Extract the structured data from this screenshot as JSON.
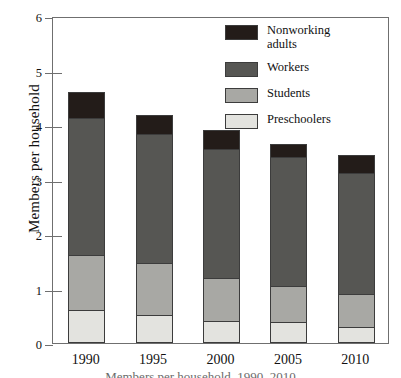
{
  "chart_data": {
    "type": "bar",
    "stacked": true,
    "title": "",
    "xlabel": "",
    "ylabel": "Members per household",
    "ylim": [
      0,
      6
    ],
    "yticks": [
      0,
      1,
      2,
      3,
      4,
      5,
      6
    ],
    "ytick_labels": [
      "0",
      "1",
      "2",
      "3",
      "4",
      "5",
      "6"
    ],
    "grid": false,
    "legend_position": "top-right",
    "categories": [
      "1990",
      "1995",
      "2000",
      "2005",
      "2010"
    ],
    "series": [
      {
        "name": "Preschoolers",
        "color": "#e3e3df",
        "values": [
          0.61,
          0.52,
          0.41,
          0.38,
          0.3
        ]
      },
      {
        "name": "Students",
        "color": "#a8a8a4",
        "values": [
          1.02,
          0.97,
          0.8,
          0.69,
          0.62
        ]
      },
      {
        "name": "Workers",
        "color": "#565653",
        "values": [
          2.54,
          2.38,
          2.39,
          2.38,
          2.24
        ]
      },
      {
        "name": "Nonworking adults",
        "color": "#231c19",
        "values": [
          0.49,
          0.38,
          0.36,
          0.26,
          0.35
        ]
      }
    ],
    "totals": [
      4.66,
      4.25,
      3.96,
      3.71,
      3.51
    ],
    "cumulative": {
      "1990": [
        0.61,
        1.63,
        4.17,
        4.66
      ],
      "1995": [
        0.52,
        1.49,
        3.87,
        4.25
      ],
      "2000": [
        0.41,
        1.21,
        3.6,
        3.96
      ],
      "2005": [
        0.38,
        1.07,
        3.45,
        3.71
      ],
      "2010": [
        0.3,
        0.92,
        3.16,
        3.51
      ]
    }
  },
  "axis": {
    "y_title": "Members per household",
    "y_tick_labels": [
      "6",
      "5",
      "4",
      "3",
      "2",
      "1",
      "0"
    ],
    "x_tick_labels": [
      "1990",
      "1995",
      "2000",
      "2005",
      "2010"
    ]
  },
  "legend": {
    "items": [
      {
        "label": "Nonworking\nadults",
        "color": "#231c19"
      },
      {
        "label": "Workers",
        "color": "#565653"
      },
      {
        "label": "Students",
        "color": "#a8a8a4"
      },
      {
        "label": "Preschoolers",
        "color": "#e3e3df"
      }
    ]
  },
  "caption": {
    "text": "Members per household, 1990–2010"
  },
  "colors": {
    "frame": "#6f6f6f",
    "bar_outline": "#3c3c3c",
    "background": "#ffffff"
  }
}
